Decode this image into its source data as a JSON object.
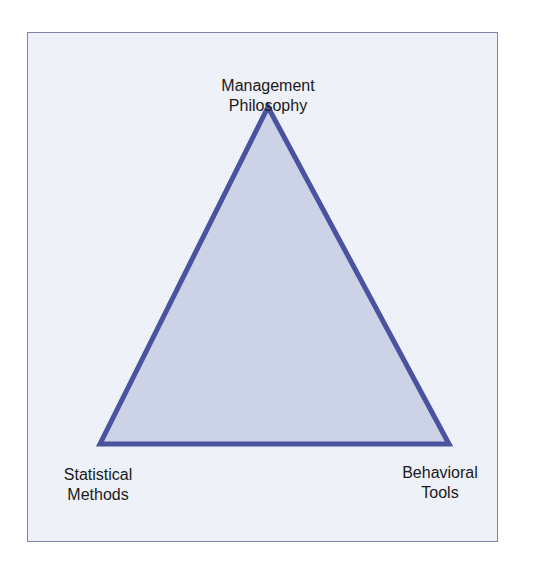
{
  "diagram": {
    "type": "triangle",
    "colors": {
      "background": "#eef1f7",
      "frame_border": "#7d84ad",
      "triangle_fill": "#cdd3e6",
      "triangle_stroke": "#4a53a0",
      "text": "#1a1a1a"
    },
    "vertices": {
      "top": {
        "label_line1": "Management",
        "label_line2": "Philosophy"
      },
      "bottom_left": {
        "label_line1": "Statistical",
        "label_line2": "Methods"
      },
      "bottom_right": {
        "label_line1": "Behavioral",
        "label_line2": "Tools"
      }
    }
  }
}
